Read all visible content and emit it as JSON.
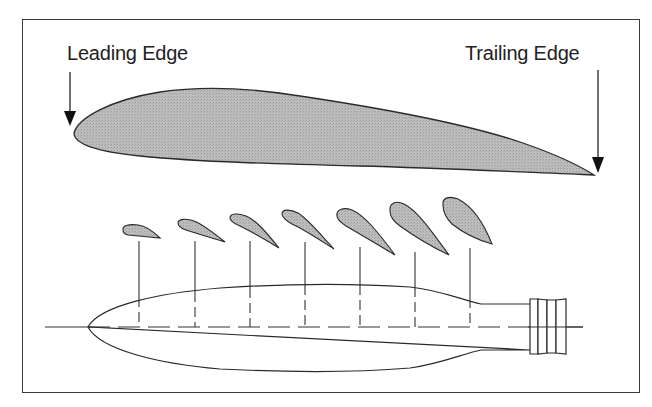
{
  "diagram": {
    "labels": {
      "leading_edge": "Leading Edge",
      "trailing_edge": "Trailing Edge"
    },
    "colors": {
      "airfoil_fill": "#b8b8b8",
      "outline": "#2a2a2a",
      "frame": "#3a3a3a",
      "background": "#ffffff"
    },
    "components": {
      "main_airfoil": "airfoil cross-section with leading edge on the left and trailing edge on the right",
      "blade_sections_count": 7,
      "blade_planform": "propeller blade outline with dashed centerline and hub at the right"
    }
  }
}
